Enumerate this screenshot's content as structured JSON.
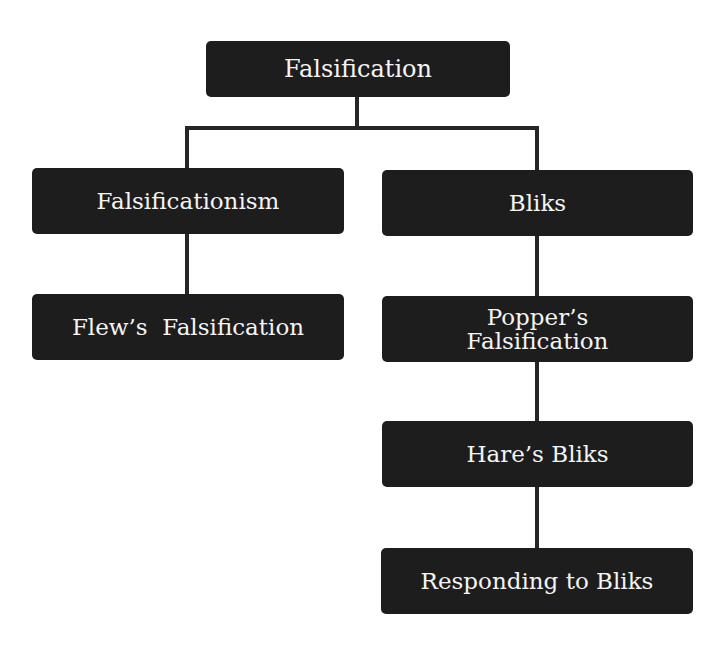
{
  "diagram": {
    "type": "hierarchy",
    "colors": {
      "node_fill": "#1d1d1d",
      "node_text": "#f4f4f4",
      "connector": "#262626",
      "background": "#ffffff"
    },
    "root": {
      "label": "Falsification"
    },
    "left_branch": {
      "label": "Falsificationism",
      "children": [
        {
          "label": "Flew’s  Falsification"
        }
      ]
    },
    "right_branch": {
      "label": "Bliks",
      "children": [
        {
          "label": "Popper’s Falsification"
        },
        {
          "label": "Hare’s Bliks"
        },
        {
          "label": "Responding to Bliks"
        }
      ]
    },
    "edges": [
      [
        "Falsification",
        "Falsificationism"
      ],
      [
        "Falsification",
        "Bliks"
      ],
      [
        "Falsificationism",
        "Flew’s Falsification"
      ],
      [
        "Bliks",
        "Popper’s Falsification"
      ],
      [
        "Popper’s Falsification",
        "Hare’s Bliks"
      ],
      [
        "Hare’s Bliks",
        "Responding to Bliks"
      ]
    ]
  }
}
